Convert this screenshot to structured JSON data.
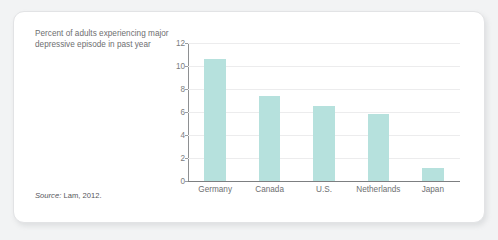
{
  "card": {
    "title": "Percent of adults experiencing major depressive episode in past year",
    "source_label": "Source:",
    "source_text": " Lam, 2012."
  },
  "chart_data": {
    "type": "bar",
    "title": "Percent of adults experiencing major depressive episode in past year",
    "categories": [
      "Germany",
      "Canada",
      "U.S.",
      "Netherlands",
      "Japan"
    ],
    "values": [
      10.6,
      7.4,
      6.5,
      5.8,
      1.1
    ],
    "xlabel": "",
    "ylabel": "",
    "ylim": [
      0,
      12
    ],
    "yticks": [
      0,
      2,
      4,
      6,
      8,
      10,
      12
    ],
    "ytick_labels": [
      "0",
      "2",
      "4",
      "6",
      "8",
      "10",
      "12"
    ],
    "grid": true,
    "legend": false,
    "bar_color": "#b6e1dd",
    "source": "Source: Lam, 2012."
  }
}
